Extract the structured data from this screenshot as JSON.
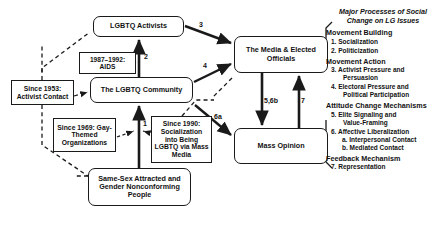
{
  "diagram": {
    "title": "Major Processes of Social Change on LG Issues",
    "nodes": {
      "activists": "LGBTQ Activists",
      "community": "The LGBTQ Community",
      "media": "The Media & Elected Officials",
      "opinion": "Mass Opinion",
      "people": "Same-Sex Attracted and Gender Nonconforming People",
      "aids": "1987–1992: AIDS",
      "contact": "Since 1953: Activist Contact",
      "orgs": "Since 1969: Gay-Themed Organizations",
      "media1990": "Since 1990: Socialization into Being LGBTQ via Mass Media"
    },
    "edge_labels": {
      "e1": "1",
      "e2": "2",
      "e3": "3",
      "e4": "4",
      "e56b": "5,6b",
      "e6a": "6a",
      "e7": "7"
    }
  },
  "legend": {
    "title_line1": "Major Processes of Social",
    "title_line2": "Change on LG Issues",
    "sections": [
      {
        "heading": "Movement Building",
        "items": [
          {
            "text": "1. Socialization"
          },
          {
            "text": "2. Politicization"
          }
        ]
      },
      {
        "heading": "Movement Action",
        "items": [
          {
            "text": "3. Activist Pressure and",
            "cont": "Persuasion"
          },
          {
            "text": "4. Electoral Pressure and",
            "cont": "Political Participation"
          }
        ]
      },
      {
        "heading": "Attitude Change Mechanisms",
        "items": [
          {
            "text": "5. Elite Signaling and",
            "cont": "Value-Framing"
          },
          {
            "text": "6. Affective Liberalization",
            "subs": [
              "a. Interpersonal Contact",
              "b. Mediated Contact"
            ]
          }
        ]
      },
      {
        "heading": "Feedback Mechanism",
        "items": [
          {
            "text": "7. Representation"
          }
        ]
      }
    ]
  },
  "colors": {
    "stroke": "#1a1a1a",
    "background": "#ffffff",
    "text": "#111111"
  }
}
